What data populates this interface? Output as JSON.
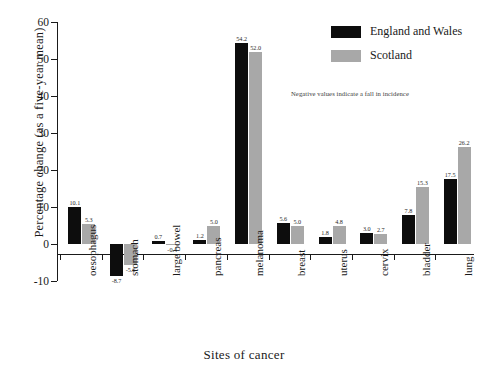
{
  "chart_data": {
    "type": "bar",
    "title": "",
    "xlabel": "Sites of cancer",
    "ylabel": "Percentage change (as a five-year mean)",
    "ylim": [
      -10,
      60
    ],
    "yticks": [
      -10,
      0,
      10,
      20,
      30,
      40,
      50,
      60
    ],
    "grid": false,
    "legend_position": "top-right",
    "annotation": "Negative values indicate a fall in incidence",
    "categories": [
      "oesophagus",
      "stomach",
      "large bowel",
      "pancreas",
      "melanoma",
      "breast",
      "uterus",
      "cervix",
      "bladder",
      "lung"
    ],
    "series": [
      {
        "name": "England and Wales",
        "color": "#0d0d0d",
        "values": [
          10.1,
          -8.7,
          0.7,
          1.2,
          54.2,
          5.6,
          1.8,
          3.0,
          7.8,
          17.5
        ],
        "labels": [
          "10.1",
          "-8.7",
          "0.7",
          "1.2",
          "54.2",
          "5.6",
          "1.8",
          "3.0",
          "7.8",
          "17.5"
        ]
      },
      {
        "name": "Scotland",
        "color": "#a8a8a8",
        "values": [
          5.3,
          -5.6,
          -0.4,
          5.0,
          52.0,
          5.0,
          4.8,
          2.7,
          15.3,
          26.2
        ],
        "labels": [
          "5.3",
          "-5.6",
          "-0.4",
          "5.0",
          "52.0",
          "5.0",
          "4.8",
          "2.7",
          "15.3",
          "26.2"
        ]
      }
    ]
  },
  "legend": {
    "items": [
      {
        "label": "England and Wales",
        "swatch": "ew"
      },
      {
        "label": "Scotland",
        "swatch": "sc"
      }
    ]
  }
}
